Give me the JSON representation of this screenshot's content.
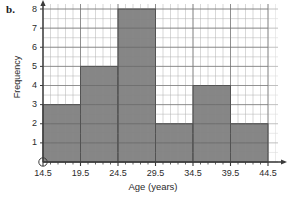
{
  "part_label": "b.",
  "chart_data": {
    "type": "bar",
    "title": "",
    "xlabel": "Age (years)",
    "ylabel": "Frequency",
    "categories": [
      "14.5-19.5",
      "19.5-24.5",
      "24.5-29.5",
      "29.5-34.5",
      "34.5-39.5",
      "39.5-44.5"
    ],
    "bin_edges": [
      14.5,
      19.5,
      24.5,
      29.5,
      34.5,
      39.5,
      44.5
    ],
    "values": [
      3,
      5,
      8,
      2,
      4,
      2
    ],
    "xticks": [
      "14.5",
      "19.5",
      "24.5",
      "29.5",
      "34.5",
      "39.5",
      "44.5"
    ],
    "yticks": [
      "1",
      "2",
      "3",
      "4",
      "5",
      "6",
      "7",
      "8"
    ],
    "xlim": [
      14.5,
      44.5
    ],
    "ylim": [
      0,
      8
    ],
    "grid": true,
    "legend": false,
    "bar_color": "#7c7c7c",
    "bar_edge_color": "#4a4a4a",
    "grid_color": "#b9b9b9",
    "grid_minor_color": "#dedede",
    "axis_color": "#3a3a3a",
    "origin_marker": "circle"
  }
}
